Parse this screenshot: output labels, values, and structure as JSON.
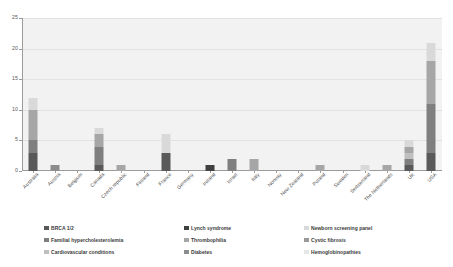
{
  "chart_data": {
    "type": "bar",
    "subtype": "stacked-bar",
    "title": "",
    "subtitle": "",
    "xlabel": "",
    "ylabel": "",
    "ylim": [
      0,
      25
    ],
    "yticks": [
      0,
      5,
      10,
      15,
      20,
      25
    ],
    "grid": true,
    "legend_position": "bottom",
    "categories": [
      "Australia",
      "Austria",
      "Belgium",
      "Canada",
      "Czech republic",
      "Finland",
      "France",
      "Germany",
      "Ireland",
      "Israel",
      "Italy",
      "Norway",
      "New Zealand",
      "Poland",
      "Sweden",
      "Switzerland",
      "The Netherlands",
      "UK",
      "USA"
    ],
    "series": [
      {
        "name": "BRCA 1/2",
        "color": "#595959",
        "values": [
          3,
          0,
          0,
          1,
          0,
          0,
          3,
          0,
          0,
          0,
          0,
          0,
          0,
          0,
          0,
          0,
          0,
          1,
          3
        ]
      },
      {
        "name": "Familial hypercholesterolemia",
        "color": "#7f7f7f",
        "values": [
          2,
          0,
          0,
          3,
          0,
          0,
          0,
          0,
          0,
          2,
          0,
          0,
          0,
          0,
          0,
          0,
          0,
          1,
          8
        ]
      },
      {
        "name": "Cardiovascular conditions",
        "color": "#bfbfbf",
        "values": [
          0,
          0,
          0,
          0,
          0,
          0,
          0,
          0,
          0,
          0,
          0,
          0,
          0,
          0,
          0,
          0,
          0,
          1,
          0
        ]
      },
      {
        "name": "Lynch syndrome",
        "color": "#404040",
        "values": [
          0,
          0,
          0,
          0,
          0,
          0,
          0,
          0,
          1,
          0,
          0,
          0,
          0,
          0,
          0,
          0,
          0,
          0,
          0
        ]
      },
      {
        "name": "Thrombophilia",
        "color": "#a6a6a6",
        "values": [
          5,
          0,
          0,
          2,
          1,
          0,
          0,
          0,
          0,
          0,
          2,
          0,
          0,
          1,
          0,
          0,
          1,
          1,
          7
        ]
      },
      {
        "name": "Diabetes",
        "color": "#8c8c8c",
        "values": [
          0,
          1,
          0,
          0,
          0,
          0,
          0,
          0,
          0,
          0,
          0,
          0,
          0,
          0,
          0,
          0,
          0,
          0,
          0
        ]
      },
      {
        "name": "Newborn screening panel",
        "color": "#d9d9d9",
        "values": [
          2,
          0,
          0,
          1,
          0,
          0,
          3,
          0,
          0,
          0,
          0,
          0,
          0,
          0,
          0,
          1,
          0,
          1,
          3
        ]
      },
      {
        "name": "Cystic fibrosis",
        "color": "#999999",
        "values": [
          0,
          0,
          0,
          0,
          0,
          0,
          0,
          0,
          0,
          0,
          0,
          0,
          0,
          0,
          0,
          0,
          0,
          0,
          0
        ]
      },
      {
        "name": "Hemoglobinopathies",
        "color": "#e6e6e6",
        "values": [
          0,
          0,
          0,
          0,
          0,
          0,
          0,
          0,
          0,
          0,
          0,
          0,
          0,
          0,
          0,
          0,
          0,
          0,
          0
        ]
      }
    ],
    "totals": [
      12,
      1,
      0,
      7,
      1,
      0,
      6,
      0,
      1,
      2,
      2,
      0,
      0,
      1,
      0,
      1,
      1,
      5,
      21
    ]
  },
  "legend": {
    "items": [
      {
        "label": "BRCA 1/2",
        "color": "#595959"
      },
      {
        "label": "Familial hypercholesterolemia",
        "color": "#7f7f7f"
      },
      {
        "label": "Cardiovascular conditions",
        "color": "#bfbfbf"
      },
      {
        "label": "Lynch syndrome",
        "color": "#404040"
      },
      {
        "label": "Thrombophilia",
        "color": "#a6a6a6"
      },
      {
        "label": "Diabetes",
        "color": "#8c8c8c"
      },
      {
        "label": "Newborn screening panel",
        "color": "#d9d9d9"
      },
      {
        "label": "Cystic fibrosis",
        "color": "#999999"
      },
      {
        "label": "Hemoglobinopathies",
        "color": "#e6e6e6"
      }
    ]
  },
  "style": {
    "plot_background": "#f2f2f2",
    "page_background": "#ffffff",
    "axis_color": "#9b9b9b",
    "gridline_color": "#e2e2e2",
    "text_color": "#3d3d3d"
  }
}
